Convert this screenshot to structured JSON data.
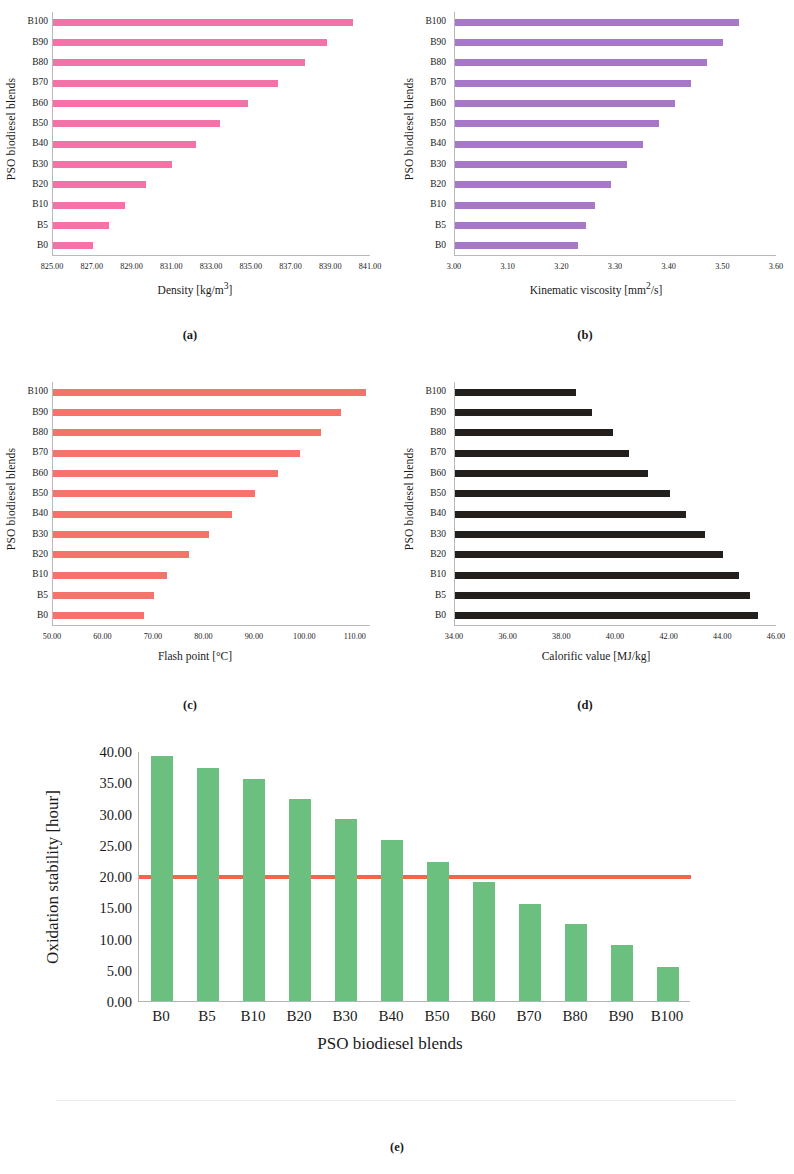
{
  "figure": {
    "panel_captions": [
      "(a)",
      "(b)",
      "(c)",
      "(d)",
      "(e)"
    ],
    "shared_category_axis_label": "PSO biodiesel blends",
    "colors": {
      "density_bar": "#F472A8",
      "viscosity_bar": "#A878C8",
      "flashpoint_bar": "#F4746B",
      "calorific_bar": "#231f1c",
      "oxidation_bar": "#6BBF7F",
      "threshold_line": "#F4654E",
      "axis": "#b9b9b9",
      "text": "#1a1a1a"
    }
  },
  "chart_data": [
    {
      "id": "a",
      "type": "bar",
      "orientation": "horizontal",
      "title": "",
      "xlabel": "Density [kg/m3]",
      "xlabel_html": "Density [kg/m<sup>3</sup>]",
      "ylabel": "PSO biodiesel blends",
      "categories": [
        "B100",
        "B90",
        "B80",
        "B70",
        "B60",
        "B50",
        "B40",
        "B30",
        "B20",
        "B10",
        "B5",
        "B0"
      ],
      "values": [
        840.1,
        838.8,
        837.7,
        836.3,
        834.8,
        833.4,
        832.2,
        831.0,
        829.7,
        828.6,
        827.8,
        827.0
      ],
      "xlim": [
        825.0,
        841.0
      ],
      "xticks": [
        825.0,
        827.0,
        829.0,
        831.0,
        833.0,
        835.0,
        837.0,
        839.0,
        841.0
      ],
      "xtick_labels": [
        "825.00",
        "827.00",
        "829.00",
        "831.00",
        "833.00",
        "835.00",
        "837.00",
        "839.00",
        "841.00"
      ],
      "grid": false,
      "legend": "none"
    },
    {
      "id": "b",
      "type": "bar",
      "orientation": "horizontal",
      "title": "",
      "xlabel": "Kinematic viscosity [mm2/s]",
      "xlabel_html": "Kinematic viscosity [mm<sup>2</sup>/s]",
      "ylabel": "PSO biodiesel blends",
      "categories": [
        "B100",
        "B90",
        "B80",
        "B70",
        "B60",
        "B50",
        "B40",
        "B30",
        "B20",
        "B10",
        "B5",
        "B0"
      ],
      "values": [
        3.53,
        3.5,
        3.47,
        3.44,
        3.41,
        3.38,
        3.35,
        3.32,
        3.29,
        3.26,
        3.245,
        3.23
      ],
      "xlim": [
        3.0,
        3.6
      ],
      "xticks": [
        3.0,
        3.1,
        3.2,
        3.3,
        3.4,
        3.5,
        3.6
      ],
      "xtick_labels": [
        "3.00",
        "3.10",
        "3.20",
        "3.30",
        "3.40",
        "3.50",
        "3.60"
      ],
      "grid": false,
      "legend": "none"
    },
    {
      "id": "c",
      "type": "bar",
      "orientation": "horizontal",
      "title": "",
      "xlabel": "Flash point [°C]",
      "xlabel_html": "Flash point [&deg;C]",
      "ylabel": "PSO biodiesel blends",
      "categories": [
        "B100",
        "B90",
        "B80",
        "B70",
        "B60",
        "B50",
        "B40",
        "B30",
        "B20",
        "B10",
        "B5",
        "B0"
      ],
      "values": [
        112.0,
        107.0,
        103.0,
        99.0,
        94.5,
        90.0,
        85.5,
        81.0,
        77.0,
        72.5,
        70.0,
        68.0
      ],
      "xlim": [
        50.0,
        113.0
      ],
      "xticks": [
        50.0,
        60.0,
        70.0,
        80.0,
        90.0,
        100.0,
        110.0
      ],
      "xtick_labels": [
        "50.00",
        "60.00",
        "70.00",
        "80.00",
        "90.00",
        "100.00",
        "110.00"
      ],
      "grid": false,
      "legend": "none"
    },
    {
      "id": "d",
      "type": "bar",
      "orientation": "horizontal",
      "title": "",
      "xlabel": "Calorific value [MJ/kg]",
      "xlabel_html": "Calorific value [MJ/kg]",
      "ylabel": "PSO biodiesel blends",
      "categories": [
        "B100",
        "B90",
        "B80",
        "B70",
        "B60",
        "B50",
        "B40",
        "B30",
        "B20",
        "B10",
        "B5",
        "B0"
      ],
      "values": [
        38.5,
        39.1,
        39.9,
        40.5,
        41.2,
        42.0,
        42.6,
        43.3,
        44.0,
        44.6,
        45.0,
        45.3
      ],
      "xlim": [
        34.0,
        46.0
      ],
      "xticks": [
        34.0,
        36.0,
        38.0,
        40.0,
        42.0,
        44.0,
        46.0
      ],
      "xtick_labels": [
        "34.00",
        "36.00",
        "38.00",
        "40.00",
        "42.00",
        "44.00",
        "46.00"
      ],
      "grid": false,
      "legend": "none"
    },
    {
      "id": "e",
      "type": "bar",
      "orientation": "vertical",
      "title": "",
      "xlabel": "PSO biodiesel blends",
      "ylabel": "Oxidation stability [hour]",
      "categories": [
        "B0",
        "B5",
        "B10",
        "B20",
        "B30",
        "B40",
        "B50",
        "B60",
        "B70",
        "B80",
        "B90",
        "B100"
      ],
      "values": [
        39.2,
        37.3,
        35.6,
        32.3,
        29.1,
        25.7,
        22.3,
        19.0,
        15.6,
        12.3,
        8.9,
        5.5
      ],
      "ylim": [
        0.0,
        40.0
      ],
      "yticks": [
        0.0,
        5.0,
        10.0,
        15.0,
        20.0,
        25.0,
        30.0,
        35.0,
        40.0
      ],
      "ytick_labels": [
        "0.00",
        "5.00",
        "10.00",
        "15.00",
        "20.00",
        "25.00",
        "30.00",
        "35.00",
        "40.00"
      ],
      "threshold_line": {
        "value": 20.0,
        "label": ""
      },
      "grid": false,
      "legend": "none"
    }
  ]
}
